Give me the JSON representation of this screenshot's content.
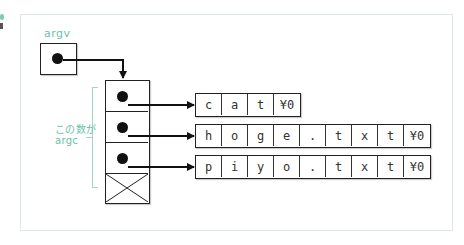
{
  "diagram": {
    "argv_label": "argv",
    "argc_label_line1": "この数が",
    "argc_label_line2": "argc",
    "strings": [
      {
        "name": "cat",
        "cells": [
          "c",
          "a",
          "t",
          "¥0"
        ]
      },
      {
        "name": "hoge.txt",
        "cells": [
          "h",
          "o",
          "g",
          "e",
          ".",
          "t",
          "x",
          "t",
          "¥0"
        ]
      },
      {
        "name": "piyo.txt",
        "cells": [
          "p",
          "i",
          "y",
          "o",
          ".",
          "t",
          "x",
          "t",
          "¥0"
        ]
      }
    ],
    "pointer_array_terminator": "NULL (crossed box)",
    "colors": {
      "label": "#6cc2a8",
      "line": "#111111",
      "frame": "#dde9e6"
    }
  }
}
